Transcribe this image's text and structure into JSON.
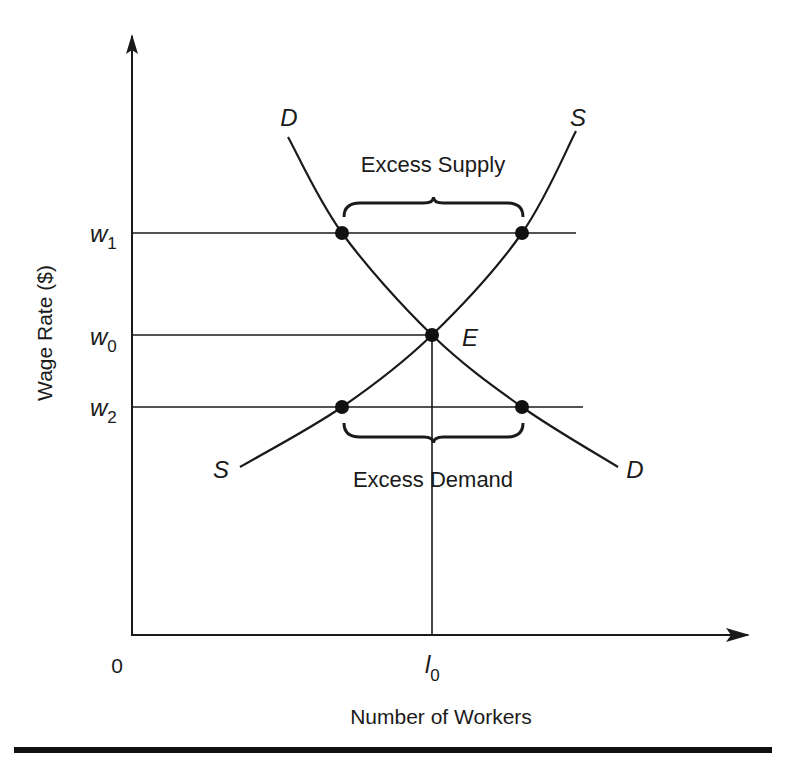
{
  "chart_data": {
    "type": "line",
    "title": "",
    "xlabel": "Number of Workers",
    "ylabel": "Wage Rate ($)",
    "origin_label": "0",
    "x_ticks": [
      {
        "label": "l",
        "sub": "0",
        "value": 0.5
      }
    ],
    "y_ticks": [
      {
        "label": "w",
        "sub": "1",
        "value": 0.67
      },
      {
        "label": "w",
        "sub": "0",
        "value": 0.5
      },
      {
        "label": "w",
        "sub": "2",
        "value": 0.38
      }
    ],
    "xlim": [
      0,
      1
    ],
    "ylim": [
      0,
      1
    ],
    "series": [
      {
        "name": "D",
        "kind": "demand",
        "points": [
          [
            0.26,
            0.83
          ],
          [
            0.35,
            0.67
          ],
          [
            0.5,
            0.5
          ],
          [
            0.65,
            0.38
          ],
          [
            0.81,
            0.28
          ]
        ]
      },
      {
        "name": "S",
        "kind": "supply",
        "points": [
          [
            0.18,
            0.28
          ],
          [
            0.35,
            0.38
          ],
          [
            0.5,
            0.5
          ],
          [
            0.65,
            0.67
          ],
          [
            0.74,
            0.84
          ]
        ]
      }
    ],
    "points": [
      {
        "name": "D-at-w1",
        "x": 0.35,
        "y": 0.67
      },
      {
        "name": "S-at-w1",
        "x": 0.65,
        "y": 0.67
      },
      {
        "name": "equilibrium",
        "x": 0.5,
        "y": 0.5,
        "label": "E"
      },
      {
        "name": "S-at-w2",
        "x": 0.35,
        "y": 0.38
      },
      {
        "name": "D-at-w2",
        "x": 0.65,
        "y": 0.38
      }
    ],
    "annotations": [
      {
        "text": "Excess Supply",
        "between_x": [
          0.35,
          0.65
        ],
        "at_y": 0.67,
        "brace": "above"
      },
      {
        "text": "Excess Demand",
        "between_x": [
          0.35,
          0.65
        ],
        "at_y": 0.38,
        "brace": "below"
      }
    ],
    "curve_labels": [
      {
        "text": "D",
        "curve": "D",
        "end": "start"
      },
      {
        "text": "S",
        "curve": "S",
        "end": "end"
      },
      {
        "text": "S",
        "curve": "S",
        "end": "start"
      },
      {
        "text": "D",
        "curve": "D",
        "end": "end"
      }
    ],
    "grid": false,
    "legend": "none"
  }
}
